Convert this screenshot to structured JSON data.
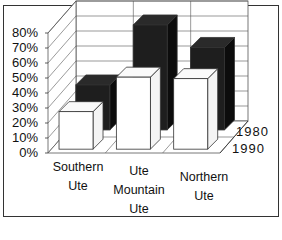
{
  "chart_data": {
    "type": "bar",
    "subtype": "3d-column-depth",
    "title": "",
    "xlabel": "",
    "ylabel": "",
    "categories": [
      "Southern Ute",
      "Ute Mountain Ute",
      "Northern Ute"
    ],
    "category_lines": [
      [
        "Southern",
        "Ute"
      ],
      [
        "Ute",
        "Mountain",
        "Ute"
      ],
      [
        "Northern",
        "Ute"
      ]
    ],
    "series": [
      {
        "name": "1980",
        "values": [
          30,
          70,
          55
        ],
        "color": "#1e1e1e"
      },
      {
        "name": "1990",
        "values": [
          25,
          48,
          47
        ],
        "color": "#ffffff"
      }
    ],
    "ylim": [
      0,
      80
    ],
    "yticks": [
      "0%",
      "10%",
      "20%",
      "30%",
      "40%",
      "50%",
      "60%",
      "70%",
      "80%"
    ],
    "depth_labels": [
      "1980",
      "1990"
    ],
    "grid": true,
    "legend": "depth-axis-right"
  }
}
